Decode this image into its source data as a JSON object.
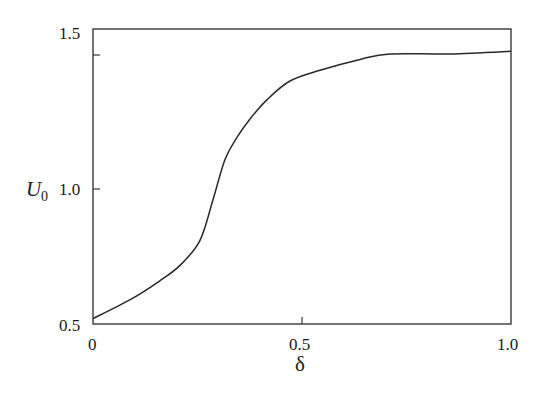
{
  "chart_data": {
    "type": "line",
    "title": "",
    "xlabel": "δ",
    "ylabel": "U",
    "ylabel_subscript": "0",
    "xlim": [
      0,
      1.0
    ],
    "ylim": [
      0.5,
      1.6
    ],
    "grid": false,
    "legend": null,
    "x_ticks": [
      {
        "value": 0,
        "label": "0"
      },
      {
        "value": 0.5,
        "label": "0.5"
      },
      {
        "value": 1.0,
        "label": "1.0"
      }
    ],
    "y_ticks": [
      {
        "value": 0.5,
        "label": "0.5"
      },
      {
        "value": 1.0,
        "label": "1.0"
      },
      {
        "value": 1.5,
        "label": "1.5"
      }
    ],
    "series": [
      {
        "name": "U0",
        "color": "#2a2a2a",
        "x": [
          0,
          0.089,
          0.16,
          0.21,
          0.256,
          0.287,
          0.316,
          0.344,
          0.376,
          0.416,
          0.471,
          0.543,
          0.639,
          0.71,
          0.854,
          1.0
        ],
        "y": [
          0.52,
          0.59,
          0.66,
          0.72,
          0.81,
          0.96,
          1.11,
          1.19,
          1.26,
          1.33,
          1.4,
          1.44,
          1.48,
          1.5,
          1.5,
          1.51
        ]
      }
    ]
  },
  "labels": {
    "x_axis": "δ",
    "y_axis_main": "U",
    "y_axis_sub": "0",
    "x_tick_0": "0",
    "x_tick_05": "0.5",
    "x_tick_10": "1.0",
    "y_tick_05": "0.5",
    "y_tick_10": "1.0",
    "y_tick_15": "1.5"
  },
  "colors": {
    "axis": "#3a3a3a",
    "curve": "#2a2a2a",
    "text": "#1a1a1a"
  }
}
